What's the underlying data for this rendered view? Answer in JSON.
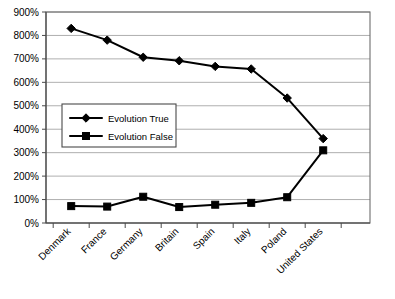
{
  "chart_data": {
    "type": "line",
    "title": "",
    "xlabel": "",
    "ylabel": "",
    "categories": [
      "Denmark",
      "France",
      "Germany",
      "Britain",
      "Spain",
      "Italy",
      "Poland",
      "United States"
    ],
    "series": [
      {
        "name": "Evolution True",
        "marker": "diamond",
        "values": [
          830,
          780,
          707,
          692,
          668,
          657,
          533,
          360
        ]
      },
      {
        "name": "Evolution False",
        "marker": "square",
        "values": [
          72,
          70,
          112,
          68,
          78,
          86,
          110,
          310
        ]
      }
    ],
    "ylim": [
      0,
      900
    ],
    "ytick_values": [
      0,
      100,
      200,
      300,
      400,
      500,
      600,
      700,
      800,
      900
    ],
    "ytick_labels": [
      "0%",
      "100%",
      "200%",
      "300%",
      "400%",
      "500%",
      "600%",
      "700%",
      "800%",
      "900%"
    ],
    "grid": true,
    "grid_axis": "y",
    "legend_position": "inside-upper-left",
    "xtick_label_rotation": -45,
    "colors": {
      "series_line": "#000000",
      "marker": "#000000",
      "gridline": "#9a9a9a",
      "axis": "#4a4a4a",
      "plot_border": "#6e6e6e",
      "background": "#ffffff"
    }
  },
  "legend": {
    "entries": [
      {
        "label": "Evolution True"
      },
      {
        "label": "Evolution False"
      }
    ]
  }
}
